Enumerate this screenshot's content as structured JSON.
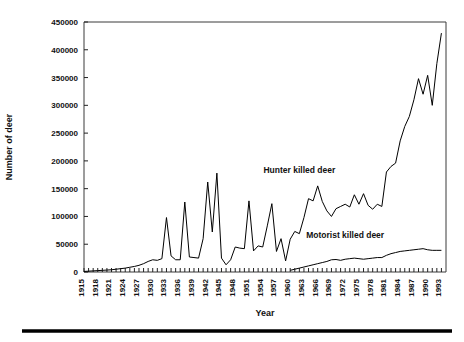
{
  "chart_data": {
    "type": "line",
    "title": "",
    "xlabel": "Year",
    "ylabel": "Number of deer",
    "xlim": [
      1915,
      1994
    ],
    "ylim": [
      0,
      450000
    ],
    "ytick_step": 50000,
    "xtick_step": 1,
    "xlabel_step": 3,
    "grid": false,
    "legend_position": "inline-annotations",
    "ytick_labels": [
      "0",
      "50000",
      "100000",
      "150000",
      "200000",
      "250000",
      "300000",
      "350000",
      "400000",
      "450000"
    ],
    "ytick_values": [
      0,
      50000,
      100000,
      150000,
      200000,
      250000,
      300000,
      350000,
      400000,
      450000
    ],
    "xtick_labels": [
      "1915",
      "1918",
      "1921",
      "1924",
      "1927",
      "1930",
      "1933",
      "1936",
      "1939",
      "1942",
      "1945",
      "1948",
      "1951",
      "1954",
      "1957",
      "1960",
      "1963",
      "1966",
      "1969",
      "1972",
      "1975",
      "1978",
      "1981",
      "1984",
      "1987",
      "1990",
      "1993"
    ],
    "x": [
      1915,
      1916,
      1917,
      1918,
      1919,
      1920,
      1921,
      1922,
      1923,
      1924,
      1925,
      1926,
      1927,
      1928,
      1929,
      1930,
      1931,
      1932,
      1933,
      1934,
      1935,
      1936,
      1937,
      1938,
      1939,
      1940,
      1941,
      1942,
      1943,
      1944,
      1945,
      1946,
      1947,
      1948,
      1949,
      1950,
      1951,
      1952,
      1953,
      1954,
      1955,
      1956,
      1957,
      1958,
      1959,
      1960,
      1961,
      1962,
      1963,
      1964,
      1965,
      1966,
      1967,
      1968,
      1969,
      1970,
      1971,
      1972,
      1973,
      1974,
      1975,
      1976,
      1977,
      1978,
      1979,
      1980,
      1981,
      1982,
      1983,
      1984,
      1985,
      1986,
      1987,
      1988,
      1989,
      1990,
      1991,
      1992,
      1993
    ],
    "series": [
      {
        "name": "Hunter killed deer",
        "label_x": 1962,
        "label_y": 178000,
        "values": [
          1000,
          1500,
          2000,
          2500,
          3000,
          3500,
          4000,
          5000,
          6000,
          7000,
          8500,
          10000,
          12000,
          15000,
          19000,
          22000,
          21000,
          24000,
          98000,
          29000,
          22000,
          22000,
          126000,
          27000,
          26000,
          25000,
          60000,
          162000,
          72000,
          178000,
          25000,
          13000,
          22000,
          45000,
          43000,
          42000,
          128000,
          38000,
          47000,
          45000,
          83000,
          123000,
          37000,
          60000,
          20000,
          59000,
          73000,
          69000,
          98000,
          132000,
          128000,
          155000,
          127000,
          110000,
          100000,
          114000,
          118000,
          122000,
          117000,
          139000,
          122000,
          141000,
          120000,
          113000,
          122000,
          118000,
          180000,
          190000,
          196000,
          236000,
          262000,
          280000,
          310000,
          348000,
          320000,
          354000,
          300000,
          375000,
          430000
        ]
      },
      {
        "name": "Motorist killed deer",
        "label_x": 1972,
        "label_y": 62000,
        "start_year": 1960,
        "values": [
          null,
          null,
          null,
          null,
          null,
          null,
          null,
          null,
          null,
          null,
          null,
          null,
          null,
          null,
          null,
          null,
          null,
          null,
          null,
          null,
          null,
          null,
          null,
          null,
          null,
          null,
          null,
          null,
          null,
          null,
          null,
          null,
          null,
          null,
          null,
          null,
          null,
          null,
          null,
          null,
          null,
          null,
          null,
          null,
          null,
          3000,
          5000,
          7000,
          9000,
          11000,
          13000,
          15000,
          17000,
          19000,
          22000,
          22500,
          21000,
          23000,
          24000,
          25000,
          24000,
          23000,
          24000,
          25000,
          26000,
          26000,
          30000,
          33000,
          35000,
          37000,
          38000,
          39000,
          40000,
          41000,
          42000,
          40000,
          39000,
          39000,
          39000
        ]
      }
    ],
    "colors": {
      "line": "#000000",
      "axis": "#3a3a3a",
      "text": "#111111"
    }
  }
}
